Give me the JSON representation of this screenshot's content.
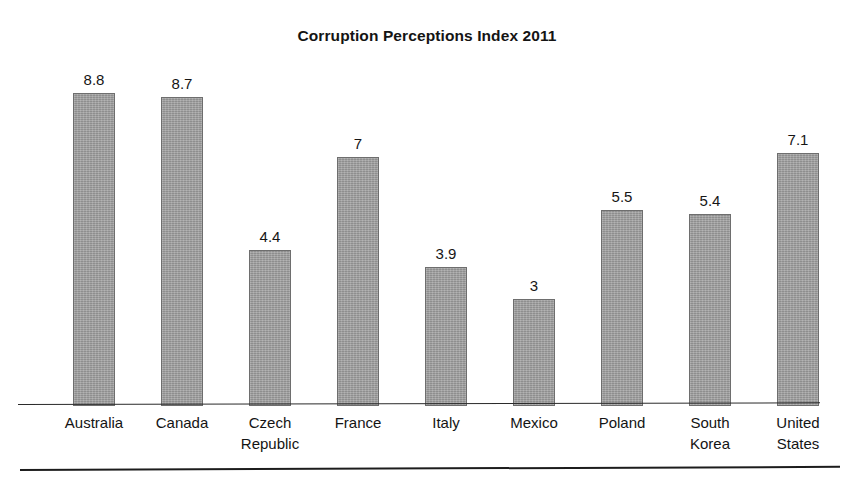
{
  "chart_data": {
    "type": "bar",
    "title": "Corruption Perceptions Index 2011",
    "xlabel": "",
    "ylabel": "",
    "ylim": [
      0,
      8.8
    ],
    "grid": false,
    "legend": false,
    "axis_visible": "x-only",
    "bar_color": "#9d9d9d",
    "bar_edge_color": "#6e6e6e",
    "value_labels_shown": true,
    "categories": [
      "Australia",
      "Canada",
      "Czech Republic",
      "France",
      "Italy",
      "Mexico",
      "Poland",
      "South Korea",
      "United States"
    ],
    "values": [
      8.8,
      8.7,
      4.4,
      7,
      3.9,
      3,
      5.5,
      5.4,
      7.1
    ],
    "value_label_text": [
      "8.8",
      "8.7",
      "4.4",
      "7",
      "3.9",
      "3",
      "5.5",
      "5.4",
      "7.1"
    ],
    "category_label_lines": [
      [
        "Australia"
      ],
      [
        "Canada"
      ],
      [
        "Czech",
        "Republic"
      ],
      [
        "France"
      ],
      [
        "Italy"
      ],
      [
        "Mexico"
      ],
      [
        "Poland"
      ],
      [
        "South",
        "Korea"
      ],
      [
        "United",
        "States"
      ]
    ]
  }
}
